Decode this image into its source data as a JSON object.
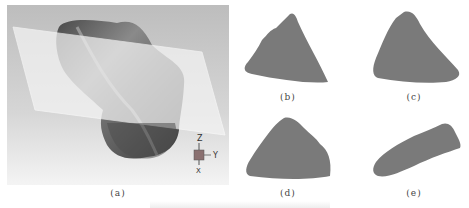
{
  "figure": {
    "panels": [
      {
        "id": "a",
        "label": "(a)",
        "content": "3D rock particle model intersected by a translucent cutting plane",
        "axes": {
          "z": "Z",
          "y": "Y",
          "x": "X"
        }
      },
      {
        "id": "b",
        "label": "(b)",
        "content": "cross-section shape"
      },
      {
        "id": "c",
        "label": "(c)",
        "content": "cross-section shape"
      },
      {
        "id": "d",
        "label": "(d)",
        "content": "cross-section shape"
      },
      {
        "id": "e",
        "label": "(e)",
        "content": "cross-section shape"
      }
    ],
    "colors": {
      "background_a": "#c8c8c8",
      "plane": "#f2f2f2",
      "rock_dark": "#555555",
      "rock_light": "#9a9a9a",
      "section_fill": "#7a7a7a"
    }
  }
}
